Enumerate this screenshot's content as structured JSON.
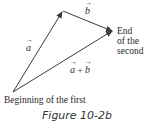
{
  "diagram": {
    "vectors": [
      {
        "name": "a",
        "label": "a",
        "from": [
          13,
          92
        ],
        "to": [
          62,
          12
        ]
      },
      {
        "name": "b",
        "label": "b",
        "from": [
          62,
          12
        ],
        "to": [
          112,
          31
        ]
      },
      {
        "name": "a_plus_b",
        "label_left": "a",
        "label_op": "+",
        "label_right": "b",
        "from": [
          13,
          92
        ],
        "to": [
          112,
          31
        ]
      }
    ],
    "arrow_symbol": "→",
    "labels": {
      "beginning": "Beginning of the first",
      "end_line1": "End",
      "end_line2": "of the",
      "end_line3": "second"
    },
    "caption": "Figure 10-2b",
    "colors": {
      "stroke": "#3a3a3a",
      "text": "#2a2a2a"
    }
  }
}
